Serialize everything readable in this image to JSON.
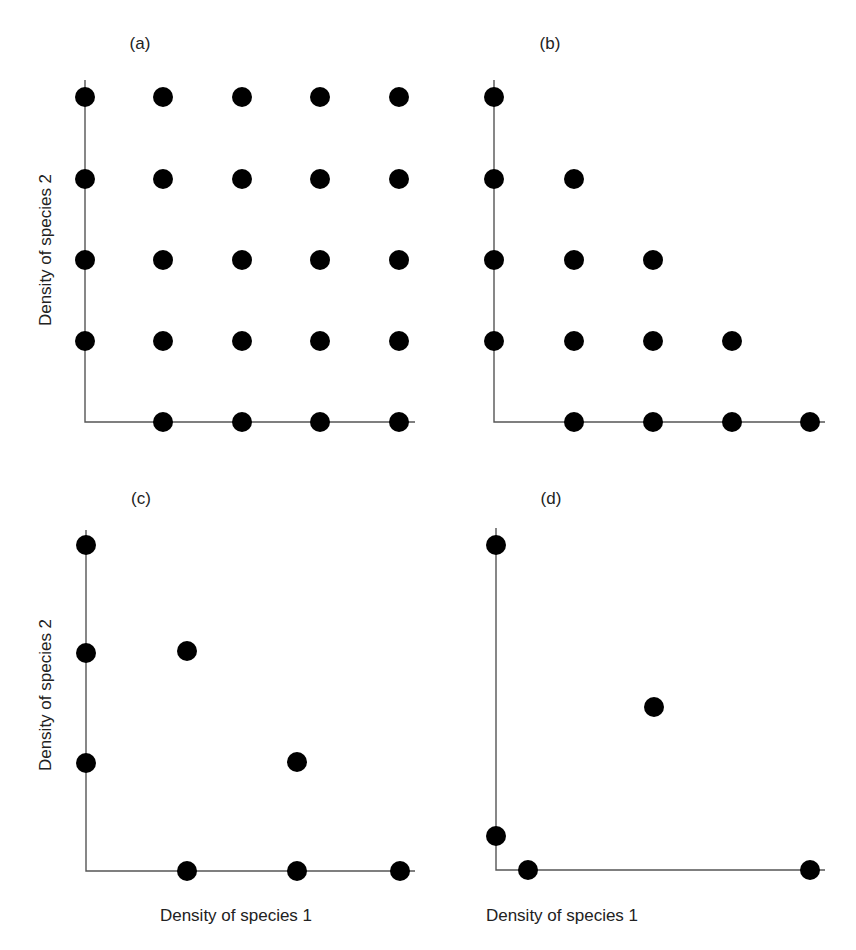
{
  "figure": {
    "dot_color": "#000000",
    "axis_color": "#555555",
    "text_color": "#222222"
  },
  "chart_data": [
    {
      "type": "scatter",
      "panel": "(a)",
      "xlabel": "",
      "ylabel": "Density of species 2",
      "description": "Full grid of stable community states",
      "grid": false,
      "points": [
        [
          0,
          4
        ],
        [
          1,
          4
        ],
        [
          2,
          4
        ],
        [
          3,
          4
        ],
        [
          4,
          4
        ],
        [
          0,
          3
        ],
        [
          1,
          3
        ],
        [
          2,
          3
        ],
        [
          3,
          3
        ],
        [
          4,
          3
        ],
        [
          0,
          2
        ],
        [
          1,
          2
        ],
        [
          2,
          2
        ],
        [
          3,
          2
        ],
        [
          4,
          2
        ],
        [
          0,
          1
        ],
        [
          1,
          1
        ],
        [
          2,
          1
        ],
        [
          3,
          1
        ],
        [
          4,
          1
        ],
        [
          1,
          0
        ],
        [
          2,
          0
        ],
        [
          3,
          0
        ],
        [
          4,
          0
        ]
      ],
      "xlim": [
        0,
        4.2
      ],
      "ylim": [
        0,
        4.2
      ]
    },
    {
      "type": "scatter",
      "panel": "(b)",
      "xlabel": "",
      "ylabel": "",
      "grid": false,
      "points": [
        [
          0,
          4
        ],
        [
          0,
          3
        ],
        [
          1,
          3
        ],
        [
          0,
          2
        ],
        [
          1,
          2
        ],
        [
          2,
          2
        ],
        [
          0,
          1
        ],
        [
          1,
          1
        ],
        [
          2,
          1
        ],
        [
          3,
          1
        ],
        [
          1,
          0
        ],
        [
          2,
          0
        ],
        [
          3,
          0
        ],
        [
          4,
          0
        ]
      ],
      "xlim": [
        0,
        4.2
      ],
      "ylim": [
        0,
        4.2
      ]
    },
    {
      "type": "scatter",
      "panel": "(c)",
      "xlabel": "Density of species 1",
      "ylabel": "Density of species 2",
      "grid": false,
      "points": [
        [
          0,
          3
        ],
        [
          0,
          2
        ],
        [
          1,
          2
        ],
        [
          0,
          1
        ],
        [
          2,
          1
        ],
        [
          1,
          0
        ],
        [
          2,
          0
        ],
        [
          3,
          0
        ]
      ],
      "xlim": [
        0,
        3.15
      ],
      "ylim": [
        0,
        3.2
      ]
    },
    {
      "type": "scatter",
      "panel": "(d)",
      "xlabel": "Density of species 1",
      "ylabel": "",
      "grid": false,
      "points": [
        [
          0,
          1.0
        ],
        [
          0.5,
          0.5
        ],
        [
          0,
          0.1
        ],
        [
          0.1,
          0
        ],
        [
          1.0,
          0
        ]
      ],
      "xlim": [
        0,
        1.04
      ],
      "ylim": [
        0,
        1.05
      ]
    }
  ],
  "panels": [
    {
      "label": "(a)",
      "ylabel": "Density of species 2",
      "xlabel": "",
      "axis": {
        "x0": 85,
        "y0": 422,
        "xend": 415,
        "ytop": 80
      },
      "dots": [
        [
          85,
          97
        ],
        [
          163,
          97
        ],
        [
          242,
          97
        ],
        [
          320,
          97
        ],
        [
          399,
          97
        ],
        [
          85,
          179
        ],
        [
          163,
          179
        ],
        [
          242,
          179
        ],
        [
          320,
          179
        ],
        [
          399,
          179
        ],
        [
          85,
          260
        ],
        [
          163,
          260
        ],
        [
          242,
          260
        ],
        [
          320,
          260
        ],
        [
          399,
          260
        ],
        [
          85,
          341
        ],
        [
          163,
          341
        ],
        [
          242,
          341
        ],
        [
          320,
          341
        ],
        [
          399,
          341
        ],
        [
          163,
          422
        ],
        [
          242,
          422
        ],
        [
          320,
          422
        ],
        [
          399,
          422
        ]
      ]
    },
    {
      "label": "(b)",
      "ylabel": "",
      "xlabel": "",
      "axis": {
        "x0": 494,
        "y0": 422,
        "xend": 825,
        "ytop": 80
      },
      "dots": [
        [
          494,
          97
        ],
        [
          494,
          179
        ],
        [
          574,
          179
        ],
        [
          494,
          260
        ],
        [
          574,
          260
        ],
        [
          653,
          260
        ],
        [
          494,
          341
        ],
        [
          574,
          341
        ],
        [
          653,
          341
        ],
        [
          732,
          341
        ],
        [
          574,
          422
        ],
        [
          653,
          422
        ],
        [
          732,
          422
        ],
        [
          810,
          422
        ]
      ]
    },
    {
      "label": "(c)",
      "ylabel": "Density of species 2",
      "xlabel": "Density of species 1",
      "axis": {
        "x0": 86,
        "y0": 871,
        "xend": 415,
        "ytop": 530
      },
      "dots": [
        [
          86,
          545
        ],
        [
          86,
          653
        ],
        [
          187,
          651
        ],
        [
          86,
          763
        ],
        [
          297,
          762
        ],
        [
          187,
          871
        ],
        [
          297,
          871
        ],
        [
          400,
          871
        ]
      ]
    },
    {
      "label": "(d)",
      "ylabel": "",
      "xlabel": "Density of species 1",
      "axis": {
        "x0": 496,
        "y0": 870,
        "xend": 825,
        "ytop": 528
      },
      "dots": [
        [
          496,
          545
        ],
        [
          654,
          707
        ],
        [
          496,
          836
        ],
        [
          528,
          870
        ],
        [
          810,
          870
        ]
      ]
    }
  ]
}
